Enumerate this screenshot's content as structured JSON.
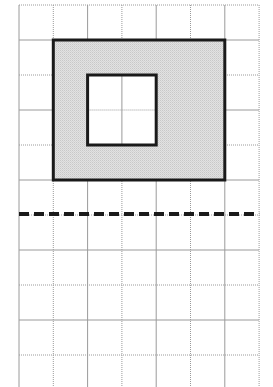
{
  "diagram": {
    "type": "grid-figure",
    "grid": {
      "columns": 7,
      "rows": 11,
      "origin_x": 19,
      "origin_y": 5,
      "cell_width": 34.3,
      "cell_height": 35,
      "line_color": "#9a9a9a",
      "line_style": "dotted"
    },
    "outer_rectangle": {
      "col_start": 1,
      "row_start": 1,
      "col_span": 5,
      "row_span": 4,
      "fill": "#dcdcdc",
      "stroke": "#1a1a1a",
      "stroke_width": 3
    },
    "inner_square": {
      "col_start": 2,
      "row_start": 2,
      "col_span": 2,
      "row_span": 2,
      "fill": "#ffffff",
      "stroke": "#1a1a1a",
      "stroke_width": 3
    },
    "dashed_line": {
      "row_index": 6,
      "stroke": "#1a1a1a",
      "stroke_width": 4,
      "dash": "10 5"
    }
  }
}
